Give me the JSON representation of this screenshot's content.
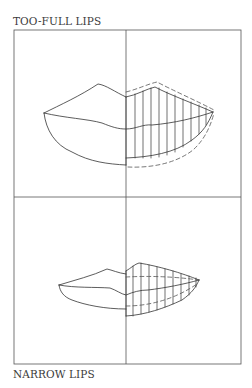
{
  "figure": {
    "panels": [
      {
        "id": "top",
        "label": "TOO-FULL LIPS",
        "description": "Over-full lips with dashed outline showing excess volume; right half hatched with vertical guide lines"
      },
      {
        "id": "bottom",
        "label": "NARROW LIPS",
        "description": "Narrow lips with dashed guide lines showing desired fuller contour; right half hatched with vertical guide lines"
      }
    ],
    "grid": {
      "frame": {
        "x": 14,
        "y": 30,
        "width": 227,
        "height": 334
      },
      "vertical_divider_x": 126,
      "horizontal_divider_y": 197
    },
    "colors": {
      "background": "#ffffff",
      "line": "#333333",
      "grid_line": "#555555",
      "dashed_line": "#555555",
      "text": "#3b3b3b"
    }
  }
}
